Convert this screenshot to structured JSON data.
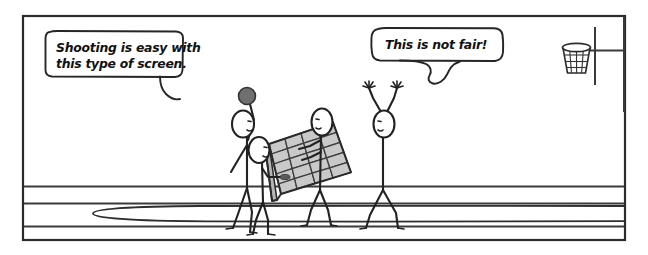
{
  "cartoon": {
    "title": "Basketball screen cartoon",
    "panel": {
      "background_color": "#ffffff",
      "border_color": "#2b2b2b"
    },
    "speech_bubbles": [
      {
        "id": "bubble-shooter",
        "speaker": "shooter-figure",
        "lines": [
          "Shooting is easy with",
          "this type of screen."
        ],
        "line1": "Shooting is easy with",
        "line2": "this type of screen."
      },
      {
        "id": "bubble-defender",
        "speaker": "defender-figure",
        "lines": [
          "This is not fair!"
        ],
        "line1": "This is not fair!"
      }
    ],
    "objects": {
      "basketball": {
        "name": "basketball",
        "color": "#6f6f6f"
      },
      "screen_panel": {
        "name": "grid-screen-panel",
        "columns": 4,
        "rows": 5,
        "fill_color": "#c9c9c9",
        "stroke_color": "#3d3d3d"
      },
      "hoop": {
        "name": "basketball-hoop",
        "parts": [
          "rim",
          "net",
          "backboard-post",
          "pole"
        ]
      },
      "court": {
        "name": "court-floor",
        "line_count": 3,
        "arc": "three-point-arc"
      }
    },
    "figures": [
      {
        "id": "shooter-figure",
        "role": "shooter holding ball"
      },
      {
        "id": "screen-holder-left",
        "role": "holds left edge of screen"
      },
      {
        "id": "screen-holder-right",
        "role": "holds right edge of screen"
      },
      {
        "id": "defender-figure",
        "role": "defender with raised arms"
      }
    ]
  }
}
